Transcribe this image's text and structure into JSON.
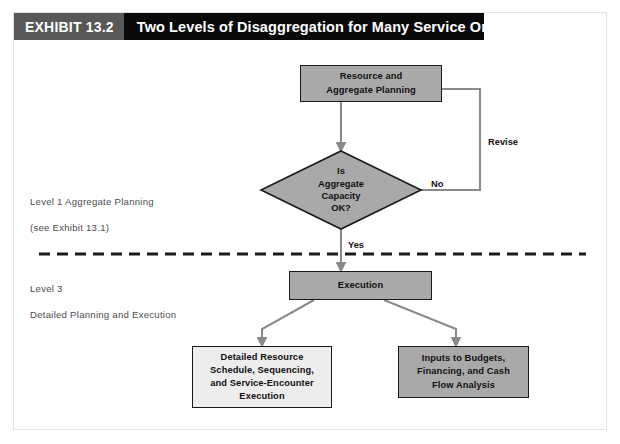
{
  "exhibit": {
    "number_label": "EXHIBIT 13.2",
    "title": "Two Levels of Disaggregation for Many Service Organizations"
  },
  "diagram": {
    "type": "flowchart",
    "nodes": [
      {
        "id": "resource-aggregate-planning",
        "shape": "rectangle",
        "fill": "#a9a9a9",
        "lines": [
          "Resource and",
          "Aggregate Planning"
        ]
      },
      {
        "id": "is-aggregate-capacity-ok",
        "shape": "diamond",
        "fill": "#a9a9a9",
        "lines": [
          "Is",
          "Aggregate",
          "Capacity",
          "OK?"
        ]
      },
      {
        "id": "execution",
        "shape": "rectangle",
        "fill": "#a9a9a9",
        "lines": [
          "Execution"
        ]
      },
      {
        "id": "detailed-resource-schedule",
        "shape": "rectangle",
        "fill": "#ededed",
        "lines": [
          "Detailed Resource",
          "Schedule, Sequencing,",
          "and Service-Encounter",
          "Execution"
        ]
      },
      {
        "id": "inputs-to-budgets",
        "shape": "rectangle",
        "fill": "#a9a9a9",
        "lines": [
          "Inputs to Budgets,",
          "Financing, and Cash",
          "Flow Analysis"
        ]
      }
    ],
    "edge_labels": {
      "no": "No",
      "yes": "Yes",
      "revise": "Revise"
    },
    "side_labels": {
      "level1_title": "Level 1 Aggregate Planning",
      "level1_note": "(see Exhibit 13.1)",
      "level3_title": "Level 3",
      "level3_note": "Detailed Planning and Execution"
    },
    "divider": {
      "style": "dashed",
      "color": "#1a1a1a"
    },
    "colors": {
      "node_fill_gray": "#a9a9a9",
      "node_fill_light": "#ededed",
      "node_stroke": "#1a1a1a",
      "connector": "#8a8a8a",
      "header_bg": "#0a0a0a",
      "header_chip_bg": "#585858"
    }
  }
}
